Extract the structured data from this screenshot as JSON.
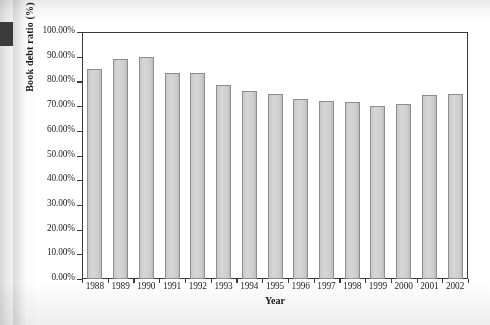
{
  "chart_data": {
    "type": "bar",
    "title": "",
    "xlabel": "Year",
    "ylabel": "Book debt ratio (%)",
    "categories": [
      "1988",
      "1989",
      "1990",
      "1991",
      "1992",
      "1993",
      "1994",
      "1995",
      "1996",
      "1997",
      "1998",
      "1999",
      "2000",
      "2001",
      "2002"
    ],
    "values": [
      85.0,
      89.0,
      90.0,
      83.5,
      83.5,
      78.5,
      76.0,
      75.0,
      73.0,
      72.0,
      71.5,
      70.0,
      71.0,
      74.5,
      75.0
    ],
    "ylim": [
      0,
      100
    ],
    "ytick_labels": [
      "100.00%",
      "90.00%",
      "80.00%",
      "70.00%",
      "60.00%",
      "50.00%",
      "40.00%",
      "30.00%",
      "20.00%",
      "10.00%",
      "0.00%"
    ],
    "ytick_values": [
      100,
      90,
      80,
      70,
      60,
      50,
      40,
      30,
      20,
      10,
      0
    ],
    "grid": false,
    "legend": "none",
    "bar_fill_color": "#d2d2d2",
    "bar_border_color": "#8d8d8d",
    "axis_color": "#3a3a3a"
  }
}
